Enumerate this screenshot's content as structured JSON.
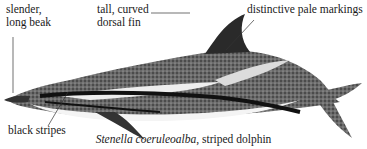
{
  "labels": {
    "beak_line1": "slender,",
    "beak_line2": "long beak",
    "fin_line1": "tall, curved",
    "fin_line2": "dorsal fin",
    "markings": "distinctive pale markings",
    "stripes": "black stripes"
  },
  "caption": {
    "species": "Stenella coeruleoalba",
    "common_name": ", striped dolphin"
  }
}
